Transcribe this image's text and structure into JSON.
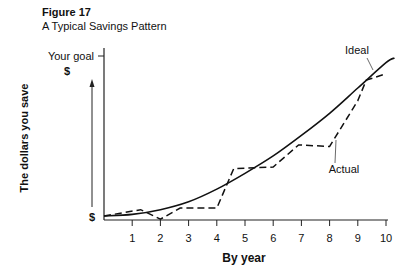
{
  "figure": {
    "label": "Figure 17",
    "title": "A Typical Savings Pattern"
  },
  "chart_data": {
    "type": "line",
    "title": "A Typical Savings Pattern",
    "xlabel": "By year",
    "ylabel": "The dollars you save",
    "x_ticks": [
      "1",
      "2",
      "3",
      "4",
      "5",
      "6",
      "7",
      "8",
      "9",
      "10"
    ],
    "y_tick_labels": {
      "top": "Your goal",
      "top_unit": "$",
      "bottom": "$"
    },
    "xlim": [
      0,
      10.3
    ],
    "ylim": [
      0,
      1
    ],
    "grid": false,
    "legend": "inline annotations",
    "annotations": [
      "Ideal",
      "Actual"
    ],
    "series": [
      {
        "name": "Ideal",
        "style": "solid",
        "x": [
          0,
          1,
          2,
          3,
          4,
          5,
          6,
          7,
          8,
          9,
          10,
          10.3
        ],
        "y": [
          0.0,
          0.01,
          0.04,
          0.09,
          0.17,
          0.27,
          0.38,
          0.51,
          0.65,
          0.81,
          0.97,
          1.0
        ]
      },
      {
        "name": "Actual",
        "style": "dashed",
        "x": [
          0,
          1.3,
          2.0,
          2.7,
          4.0,
          4.6,
          6.0,
          6.9,
          8.0,
          9.0,
          9.3,
          10.0
        ],
        "y": [
          0.0,
          0.04,
          -0.02,
          0.05,
          0.05,
          0.3,
          0.31,
          0.45,
          0.44,
          0.73,
          0.86,
          0.9
        ]
      }
    ]
  }
}
